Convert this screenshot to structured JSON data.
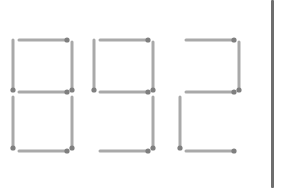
{
  "puzzle": {
    "displayed_number": "892",
    "digits": [
      {
        "value": "8",
        "segments": [
          "top",
          "top-left",
          "top-right",
          "middle",
          "bottom-left",
          "bottom-right",
          "bottom"
        ]
      },
      {
        "value": "9",
        "segments": [
          "top",
          "top-left",
          "top-right",
          "middle",
          "bottom-right",
          "bottom"
        ]
      },
      {
        "value": "2",
        "segments": [
          "top",
          "top-right",
          "middle",
          "bottom-left",
          "bottom"
        ]
      }
    ],
    "colors": {
      "stick": "#a9a9a9",
      "head": "#7f7f7f",
      "divider": "#6e6e6e",
      "background": "#ffffff"
    }
  }
}
